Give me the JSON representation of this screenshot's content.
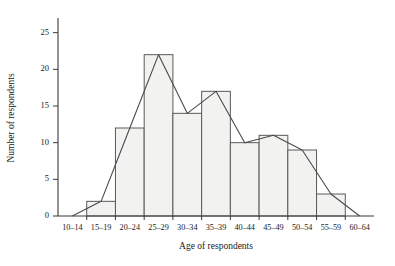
{
  "chart_data": {
    "type": "bar",
    "title": "",
    "subtitle": "",
    "xlabel": "Age of respondents",
    "ylabel": "Number of respondents",
    "categories": [
      "10–14",
      "15–19",
      "20–24",
      "25–29",
      "30–34",
      "35–39",
      "40–44",
      "45–49",
      "50–54",
      "55–59",
      "60–64"
    ],
    "values": [
      0,
      2,
      12,
      22,
      14,
      17,
      10,
      11,
      9,
      3,
      0
    ],
    "series": [
      {
        "name": "Histogram bars",
        "type": "bar",
        "values": [
          0,
          2,
          12,
          22,
          14,
          17,
          10,
          11,
          9,
          3,
          0
        ]
      },
      {
        "name": "Frequency polygon",
        "type": "line",
        "values": [
          0,
          2,
          12,
          22,
          14,
          17,
          10,
          11,
          9,
          3,
          0
        ]
      }
    ],
    "ylim": [
      0,
      27
    ],
    "yticks": [
      0,
      5,
      10,
      15,
      20,
      25
    ],
    "ytick_labels": [
      "0",
      "5",
      "10",
      "15",
      "20",
      "25"
    ],
    "xtick_labels": [
      "10–14",
      "15–19",
      "20–24",
      "25–29",
      "30–34",
      "35–39",
      "40–44",
      "45–49",
      "50–54",
      "55–59",
      "60–64"
    ],
    "grid": false,
    "legend": "none",
    "bar_fill_color": "#f2f2f0",
    "bar_edge_color": "#5a5a5a",
    "line_color": "#4a4a4a",
    "axis_color": "#3a3a3a",
    "background_color": "#ffffff"
  },
  "axis": {
    "x_title": "Age of respondents",
    "y_title": "Number of respondents"
  },
  "yticks": {
    "t0": "0",
    "t1": "5",
    "t2": "10",
    "t3": "15",
    "t4": "20",
    "t5": "25"
  },
  "xticks": {
    "c0": "10–14",
    "c1": "15–19",
    "c2": "20–24",
    "c3": "25–29",
    "c4": "30–34",
    "c5": "35–39",
    "c6": "40–44",
    "c7": "45–49",
    "c8": "50–54",
    "c9": "55–59",
    "c10": "60–64"
  }
}
